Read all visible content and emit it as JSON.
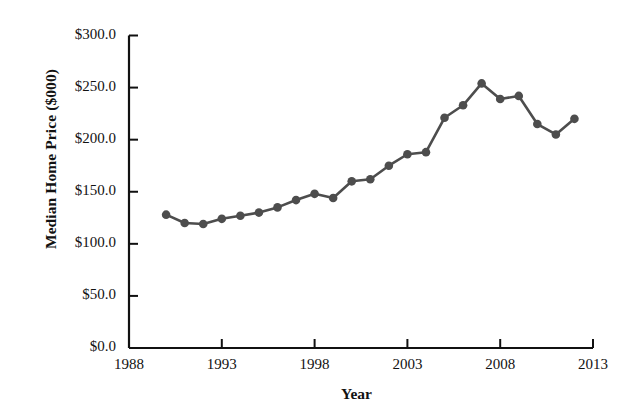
{
  "chart_data": {
    "type": "line",
    "title": "",
    "xlabel": "Year",
    "ylabel": "Median Home Price ($000)",
    "x": [
      1990,
      1991,
      1992,
      1993,
      1994,
      1995,
      1996,
      1997,
      1998,
      1999,
      2000,
      2001,
      2002,
      2003,
      2004,
      2005,
      2006,
      2007,
      2008,
      2009,
      2010,
      2011
    ],
    "values": [
      128.0,
      120.0,
      119.0,
      124.0,
      127.0,
      130.0,
      135.0,
      142.0,
      148.0,
      144.0,
      160.0,
      162.0,
      175.0,
      186.0,
      188.0,
      221.0,
      233.0,
      254.0,
      239.0,
      242.0,
      215.0,
      205.0
    ],
    "series": [
      {
        "name": "Median Home Price",
        "values": [
          128.0,
          120.0,
          119.0,
          124.0,
          127.0,
          130.0,
          135.0,
          142.0,
          148.0,
          144.0,
          160.0,
          162.0,
          175.0,
          186.0,
          188.0,
          221.0,
          233.0,
          254.0,
          239.0,
          242.0,
          215.0,
          205.0
        ]
      }
    ],
    "points": [
      {
        "x": 1990,
        "y": 128.0
      },
      {
        "x": 1991,
        "y": 120.0
      },
      {
        "x": 1992,
        "y": 119.0
      },
      {
        "x": 1993,
        "y": 124.0
      },
      {
        "x": 1994,
        "y": 127.0
      },
      {
        "x": 1995,
        "y": 130.0
      },
      {
        "x": 1996,
        "y": 135.0
      },
      {
        "x": 1997,
        "y": 142.0
      },
      {
        "x": 1998,
        "y": 148.0
      },
      {
        "x": 1999,
        "y": 144.0
      },
      {
        "x": 2000,
        "y": 160.0
      },
      {
        "x": 2001,
        "y": 162.0
      },
      {
        "x": 2002,
        "y": 175.0
      },
      {
        "x": 2003,
        "y": 186.0
      },
      {
        "x": 2004,
        "y": 188.0
      },
      {
        "x": 2005,
        "y": 221.0
      },
      {
        "x": 2006,
        "y": 233.0
      },
      {
        "x": 2007,
        "y": 254.0
      },
      {
        "x": 2008,
        "y": 239.0
      },
      {
        "x": 2009,
        "y": 242.0
      },
      {
        "x": 2010,
        "y": 215.0
      },
      {
        "x": 2011,
        "y": 205.0
      },
      {
        "x": 2012,
        "y": 220.0
      }
    ],
    "xlim": [
      1988,
      2013
    ],
    "ylim": [
      0,
      300
    ],
    "xticks": [
      1988,
      1993,
      1998,
      2003,
      2008,
      2013
    ],
    "xtick_labels": [
      "1988",
      "1993",
      "1998",
      "2003",
      "2008",
      "2013"
    ],
    "yticks": [
      0,
      50,
      100,
      150,
      200,
      250,
      300
    ],
    "ytick_labels": [
      "$0.0",
      "$50.0",
      "$100.0",
      "$150.0",
      "$200.0",
      "$250.0",
      "$300.0"
    ],
    "grid": false,
    "legend": false,
    "line_color": "#4d4d4d",
    "marker_color": "#4d4d4d",
    "marker": "circle",
    "axis_color": "#111111",
    "background": "#ffffff"
  }
}
